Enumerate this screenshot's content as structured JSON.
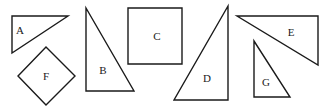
{
  "figure": {
    "width": 328,
    "height": 111,
    "stroke_color": "#1a1a1a",
    "background": "#ffffff",
    "shapes": [
      {
        "id": "A",
        "type": "right-triangle",
        "points": "12,16 68,16 12,53",
        "label": "A",
        "label_pos": [
          20,
          31
        ]
      },
      {
        "id": "B",
        "type": "right-triangle",
        "points": "86,8 86,91 134,91",
        "label": "B",
        "label_pos": [
          103,
          71
        ]
      },
      {
        "id": "C",
        "type": "square",
        "points": "128,8 182,8 182,64 128,64",
        "label": "C",
        "label_pos": [
          157,
          37
        ]
      },
      {
        "id": "D",
        "type": "right-triangle",
        "points": "228,6 174,100 228,100",
        "label": "D",
        "label_pos": [
          207,
          79
        ]
      },
      {
        "id": "E",
        "type": "right-triangle",
        "points": "237,16 318,16 318,65",
        "label": "E",
        "label_pos": [
          291,
          33
        ]
      },
      {
        "id": "F",
        "type": "square-rotated",
        "points": "46,47 75,76 46,105 18,76",
        "label": "F",
        "label_pos": [
          46,
          77
        ]
      },
      {
        "id": "G",
        "type": "right-triangle",
        "points": "254,41 254,97 290,97",
        "label": "G",
        "label_pos": [
          266,
          83
        ]
      }
    ]
  }
}
